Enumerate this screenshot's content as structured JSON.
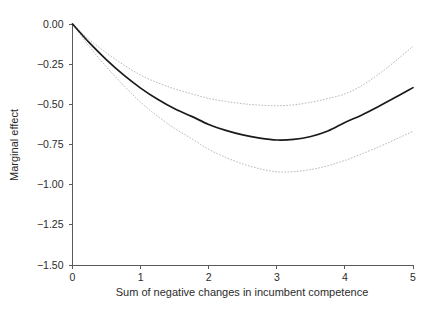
{
  "chart_data": {
    "type": "line",
    "title": "",
    "subtitle": "",
    "xlabel": "Sum of negative changes in incumbent competence",
    "ylabel": "Marginal effect",
    "xlim": [
      0,
      5
    ],
    "ylim": [
      -1.5,
      0.0
    ],
    "grid": false,
    "legend_position": "none",
    "xticks": [
      "0",
      "1",
      "2",
      "3",
      "4",
      "5"
    ],
    "xtick_values": [
      0,
      1,
      2,
      3,
      4,
      5
    ],
    "yticks": [
      "0.00",
      "-0.25",
      "-0.50",
      "-0.75",
      "-1.00",
      "-1.25",
      "-1.50"
    ],
    "ytick_values": [
      0.0,
      -0.25,
      -0.5,
      -0.75,
      -1.0,
      -1.25,
      -1.5
    ],
    "x": [
      0,
      0.25,
      0.5,
      0.75,
      1,
      1.25,
      1.5,
      1.75,
      2,
      2.25,
      2.5,
      2.75,
      3,
      3.25,
      3.5,
      3.75,
      4,
      4.25,
      4.5,
      4.75,
      5
    ],
    "series": [
      {
        "name": "Marginal effect",
        "style": "solid",
        "color": "#1a1a1a",
        "values": [
          0.0,
          -0.118,
          -0.223,
          -0.317,
          -0.399,
          -0.469,
          -0.528,
          -0.575,
          -0.625,
          -0.662,
          -0.69,
          -0.71,
          -0.722,
          -0.718,
          -0.7,
          -0.666,
          -0.613,
          -0.566,
          -0.512,
          -0.455,
          -0.396
        ]
      },
      {
        "name": "Upper 95% confidence bound",
        "style": "dashed",
        "color": "#b9b9b9",
        "values": [
          0.0,
          -0.098,
          -0.18,
          -0.254,
          -0.318,
          -0.366,
          -0.404,
          -0.435,
          -0.463,
          -0.482,
          -0.496,
          -0.505,
          -0.509,
          -0.503,
          -0.487,
          -0.464,
          -0.435,
          -0.383,
          -0.311,
          -0.228,
          -0.138
        ]
      },
      {
        "name": "Lower 95% confidence bound",
        "style": "dashed",
        "color": "#b9b9b9",
        "values": [
          0.0,
          -0.142,
          -0.268,
          -0.382,
          -0.487,
          -0.574,
          -0.65,
          -0.714,
          -0.78,
          -0.83,
          -0.871,
          -0.901,
          -0.92,
          -0.919,
          -0.906,
          -0.882,
          -0.849,
          -0.808,
          -0.764,
          -0.717,
          -0.668
        ]
      }
    ]
  },
  "axes": {
    "y_axis_title": "Marginal effect",
    "x_axis_title": "Sum of negative changes in incumbent competence"
  }
}
